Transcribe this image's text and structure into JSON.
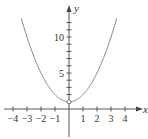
{
  "chart_data": {
    "type": "line",
    "title": "",
    "xlabel": "x",
    "ylabel": "y",
    "function": "y = x^2 + 1",
    "xlim": [
      -4.6,
      5.1
    ],
    "ylim": [
      -2.5,
      15
    ],
    "x_ticks": [
      -4,
      -3,
      -2,
      -1,
      1,
      2,
      3,
      4
    ],
    "x_tick_labels": [
      "−4",
      "−3",
      "−2",
      "−1",
      "1",
      "2",
      "3",
      "4"
    ],
    "y_ticks": [
      1,
      2,
      3,
      4,
      5,
      6,
      7,
      8,
      9,
      10,
      11,
      12
    ],
    "y_tick_labels": [
      {
        "value": 5,
        "label": "5"
      },
      {
        "value": 10,
        "label": "10"
      }
    ],
    "series": [
      {
        "name": "curve",
        "x": [
          -3.4,
          -3,
          -2.5,
          -2,
          -1.5,
          -1,
          -0.5,
          0,
          0.5,
          1,
          1.5,
          2,
          2.5,
          3,
          3.4
        ],
        "y": [
          12.56,
          10,
          7.25,
          5,
          3.25,
          2,
          1.25,
          1,
          1.25,
          2,
          3.25,
          5,
          7.25,
          10,
          12.56
        ]
      }
    ],
    "annotations": [
      {
        "type": "open-circle",
        "x": 0,
        "y": 1
      }
    ],
    "grid": false,
    "legend": null,
    "colors": {
      "curve": "#888888",
      "axis": "#555555"
    }
  }
}
